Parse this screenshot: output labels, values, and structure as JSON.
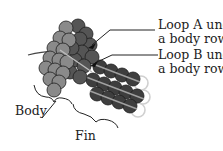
{
  "diagram": {
    "labels": {
      "loop_a_line1": "Loop A under",
      "loop_a_line2": "a body row",
      "loop_b_line1": "Loop B under",
      "loop_b_line2": "a body row",
      "body": "Body",
      "fin": "Fin"
    },
    "colors": {
      "body_light": "#8a8a8a",
      "body_dark": "#5a5a5a",
      "fin_dark": "#3e3e3e",
      "fin_stripe": "#9a9a9a",
      "fin_ghost": "#d6d6d6",
      "outline": "#1e1e1e",
      "text": "#222222"
    }
  }
}
